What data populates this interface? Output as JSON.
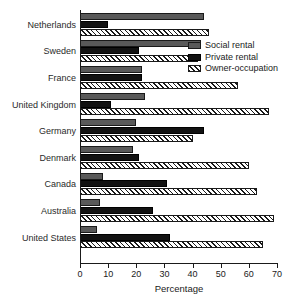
{
  "chart_data": {
    "type": "bar",
    "orientation": "horizontal",
    "title": "",
    "xlabel": "Percentage",
    "ylabel": "",
    "xlim": [
      0,
      70
    ],
    "xticks": [
      0,
      10,
      20,
      30,
      40,
      50,
      60,
      70
    ],
    "xtick_labels": [
      "0",
      "10",
      "20",
      "30",
      "40",
      "50",
      "60",
      "70"
    ],
    "grid": false,
    "legend_position": "upper right",
    "categories": [
      "Netherlands",
      "Sweden",
      "France",
      "United Kingdom",
      "Germany",
      "Denmark",
      "Canada",
      "Australia",
      "United States"
    ],
    "series": [
      {
        "name": "Social rental",
        "color": "#595959",
        "fill": "solid-gray",
        "values": [
          44,
          43,
          22,
          23,
          20,
          19,
          8,
          7,
          6
        ]
      },
      {
        "name": "Private rental",
        "color": "#121212",
        "fill": "solid-black",
        "values": [
          10,
          21,
          22,
          11,
          44,
          21,
          31,
          26,
          32
        ]
      },
      {
        "name": "Owner-occupation",
        "color": "#ffffff",
        "fill": "diagonal-hatch",
        "values": [
          46,
          42,
          56,
          67,
          40,
          60,
          63,
          69,
          65
        ]
      }
    ]
  },
  "axis": {
    "x_title": "Percentage"
  },
  "legend": {
    "items": [
      {
        "label": "Social rental",
        "swatch": "social"
      },
      {
        "label": "Private rental",
        "swatch": "private"
      },
      {
        "label": "Owner-occupation",
        "swatch": "owner"
      }
    ]
  }
}
